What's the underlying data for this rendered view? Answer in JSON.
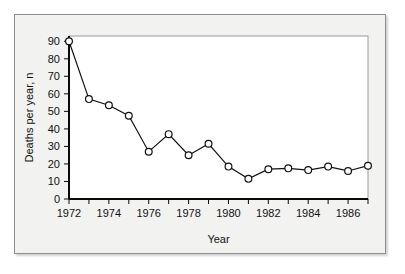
{
  "chart_data": {
    "type": "line",
    "title": "",
    "xlabel": "Year",
    "ylabel": "Deaths per year, n",
    "xlim": [
      1972,
      1987
    ],
    "ylim": [
      0,
      93
    ],
    "grid": false,
    "legend": "none",
    "marker": "open-circle",
    "x": [
      1972,
      1973,
      1974,
      1975,
      1976,
      1977,
      1978,
      1979,
      1980,
      1981,
      1982,
      1983,
      1984,
      1985,
      1986,
      1987
    ],
    "values": [
      90,
      57,
      53.5,
      47.5,
      27,
      37,
      25,
      31.5,
      18.5,
      11.5,
      17,
      17.5,
      16.5,
      18.5,
      16,
      19
    ],
    "y_ticks": [
      0,
      10,
      20,
      30,
      40,
      50,
      60,
      70,
      80,
      90
    ],
    "y_tick_labels": [
      "0",
      "10",
      "20",
      "30",
      "40",
      "50",
      "60",
      "70",
      "80",
      "90"
    ],
    "x_ticks": [
      1972,
      1973,
      1974,
      1975,
      1976,
      1977,
      1978,
      1979,
      1980,
      1981,
      1982,
      1983,
      1984,
      1985,
      1986,
      1987
    ],
    "x_tick_labels": [
      "1972",
      "",
      "1974",
      "",
      "1976",
      "",
      "1978",
      "",
      "1980",
      "",
      "1982",
      "",
      "1984",
      "",
      "1986",
      ""
    ],
    "colors": {
      "line": "#111111",
      "marker_fill": "#ffffff",
      "marker_stroke": "#111111",
      "plot_background": "#ffffff",
      "figure_background": "#f2f2f0",
      "axis": "#0a0a0a"
    }
  }
}
